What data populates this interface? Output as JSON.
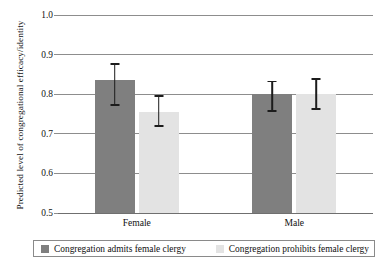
{
  "chart_data": {
    "type": "bar",
    "title": "",
    "xlabel": "",
    "ylabel": "Predicted level of congregational efficacy/identity",
    "categories": [
      "Female",
      "Male"
    ],
    "ylim": [
      0.5,
      1.0
    ],
    "yticks": [
      "1.0",
      "0.9",
      "0.8",
      "0.7",
      "0.6",
      "0.5"
    ],
    "ytick_values": [
      1.0,
      0.9,
      0.8,
      0.7,
      0.6,
      0.5
    ],
    "grid": true,
    "legend_position": "bottom",
    "series": [
      {
        "name": "Congregation admits female clergy",
        "color": "#7f7f7f",
        "values": [
          0.835,
          0.8
        ],
        "error_low": [
          0.772,
          0.757
        ],
        "error_high": [
          0.877,
          0.832
        ]
      },
      {
        "name": "Congregation prohibits female clergy",
        "color": "#e3e3e3",
        "values": [
          0.755,
          0.8
        ],
        "error_low": [
          0.72,
          0.762
        ],
        "error_high": [
          0.795,
          0.838
        ]
      }
    ]
  },
  "axis": {
    "y_title": "Predicted level of congregational efficacy/identity",
    "y_ticks": [
      "1.0",
      "0.9",
      "0.8",
      "0.7",
      "0.6",
      "0.5"
    ],
    "x_ticks": [
      "Female",
      "Male"
    ]
  },
  "legend": {
    "items": [
      {
        "label": "Congregation admits female clergy",
        "color": "#7f7f7f"
      },
      {
        "label": "Congregation prohibits female clergy",
        "color": "#e3e3e3"
      }
    ]
  }
}
